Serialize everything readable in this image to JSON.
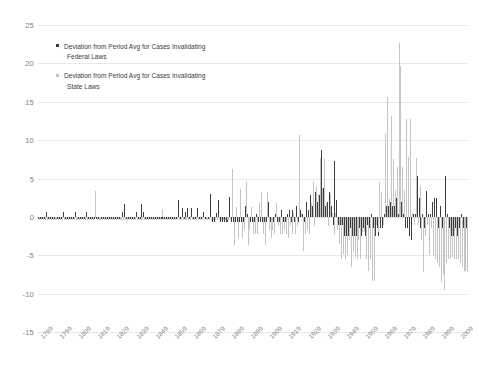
{
  "chart_data": {
    "type": "bar",
    "title": "",
    "subtitle": "",
    "xlabel": "",
    "ylabel": "",
    "ylim": [
      -15,
      25
    ],
    "yticks": [
      25,
      20,
      15,
      10,
      5,
      0,
      -5,
      -10,
      -15
    ],
    "grid": true,
    "legend_position": "inside-top-left",
    "xlim": [
      1789,
      2013
    ],
    "xtick_labels": [
      "1789",
      "1799",
      "1809",
      "1819",
      "1829",
      "1839",
      "1849",
      "1859",
      "1869",
      "1879",
      "1889",
      "1899",
      "1909",
      "1919",
      "1929",
      "1939",
      "1949",
      "1959",
      "1969",
      "1979",
      "1989",
      "1999",
      "2009"
    ],
    "colors": {
      "federal": "#3d3d3d",
      "state": "#c4c4c4",
      "gridline": "#e8e8e8",
      "tick_text": "#8a8a8a",
      "background": "#ffffff"
    },
    "series": [
      {
        "name": "Deviation from Period Avg for Cases Invalidating Federal Laws",
        "short_name": "federal",
        "color": "#3d3d3d",
        "x_start": 1789,
        "values": [
          -0.3,
          -0.3,
          -0.3,
          -0.3,
          0.7,
          -0.3,
          -0.3,
          -0.3,
          -0.3,
          -0.3,
          -0.3,
          -0.3,
          -0.3,
          0.7,
          -0.3,
          -0.3,
          -0.3,
          -0.3,
          -0.3,
          0.7,
          -0.3,
          -0.3,
          -0.3,
          -0.3,
          -0.3,
          0.7,
          -0.3,
          -0.3,
          -0.3,
          -0.3,
          -0.3,
          -0.3,
          -0.3,
          -0.3,
          -0.3,
          -0.3,
          -0.3,
          -0.3,
          -0.3,
          -0.3,
          -0.3,
          -0.3,
          -0.3,
          -0.3,
          0.7,
          1.7,
          -0.3,
          -0.3,
          -0.3,
          -0.3,
          -0.3,
          0.7,
          -0.3,
          -0.3,
          1.7,
          0.7,
          -0.3,
          -0.3,
          -0.3,
          -0.3,
          -0.3,
          -0.3,
          -0.3,
          -0.3,
          -0.3,
          -0.3,
          -0.3,
          -0.3,
          -0.3,
          -0.3,
          -0.3,
          -0.3,
          -0.3,
          2.2,
          -0.3,
          1.2,
          -0.3,
          0.7,
          1.2,
          -0.3,
          1.2,
          -0.3,
          -0.3,
          1.2,
          -0.3,
          -0.3,
          0.7,
          -0.3,
          -0.3,
          -0.3,
          3.0,
          -0.7,
          -0.7,
          0.5,
          2.2,
          -0.7,
          -0.7,
          -0.7,
          -0.7,
          -0.7,
          2.6,
          -0.7,
          -0.7,
          -0.7,
          -0.7,
          -0.7,
          -0.7,
          -0.7,
          1.4,
          0.4,
          -0.7,
          -0.7,
          -0.7,
          -0.7,
          0.4,
          -0.7,
          -0.7,
          -0.7,
          -0.7,
          -0.7,
          1.9,
          -0.7,
          -0.7,
          -0.7,
          0.4,
          -0.7,
          -0.7,
          0.9,
          -0.7,
          -0.7,
          0.4,
          0.9,
          -0.7,
          0.9,
          -0.7,
          1.4,
          -0.7,
          0.9,
          0.4,
          -0.7,
          1.9,
          0.9,
          2.9,
          1.4,
          0.4,
          3.3,
          1.9,
          2.9,
          8.7,
          3.8,
          1.4,
          1.9,
          3.3,
          1.4,
          -1.1,
          7.3,
          2.2,
          -1.1,
          -1.1,
          -1.1,
          -2.5,
          -2.5,
          -2.5,
          -1.5,
          -2.5,
          -2.5,
          -2.5,
          -2.5,
          -1.5,
          -2.5,
          -1.5,
          -2.5,
          -1.0,
          -1.5,
          0.4,
          -1.5,
          -2.5,
          -1.5,
          -2.5,
          -1.5,
          -1.5,
          0.4,
          1.4,
          1.4,
          1.9,
          1.4,
          1.4,
          2.4,
          0.4,
          2.4,
          1.9,
          0.4,
          -1.5,
          -1.5,
          -2.5,
          -3.0,
          0.4,
          0.4,
          5.3,
          2.4,
          -1.5,
          0.4,
          -1.5,
          3.4,
          0.4,
          0.4,
          1.9,
          2.4,
          2.4,
          -1.5,
          1.4,
          -1.5,
          -1.5,
          5.3,
          0.4,
          -1.5,
          -2.5,
          -2.5,
          -1.5,
          -2.5,
          -1.5,
          0.4,
          -1.5,
          -2.5,
          -1.5
        ]
      },
      {
        "name": "Deviation from Period Avg for Cases Invalidating State Laws",
        "short_name": "state",
        "color": "#c4c4c4",
        "x_start": 1789,
        "values": [
          -0.4,
          -0.4,
          -0.4,
          -0.4,
          -0.4,
          -0.4,
          -0.4,
          -0.4,
          -0.4,
          -0.4,
          -0.4,
          -0.4,
          -0.4,
          -0.4,
          -0.4,
          -0.4,
          -0.4,
          -0.4,
          -0.4,
          -0.4,
          -0.4,
          -0.4,
          -0.4,
          -0.4,
          -0.4,
          -0.4,
          -0.4,
          -0.4,
          -0.4,
          3.4,
          -0.4,
          -0.4,
          -0.4,
          -0.4,
          -0.4,
          -0.4,
          -0.4,
          -0.4,
          -0.4,
          -0.4,
          -0.4,
          -0.4,
          -0.4,
          -0.4,
          -0.4,
          -0.4,
          -0.4,
          -0.4,
          -0.4,
          -0.4,
          -0.4,
          -0.4,
          -0.4,
          -0.4,
          -0.4,
          -0.4,
          -0.4,
          -0.4,
          -0.4,
          -0.4,
          -0.4,
          -0.4,
          -0.4,
          -0.4,
          1.0,
          -0.4,
          -0.4,
          -0.4,
          -0.4,
          -0.4,
          -0.4,
          -0.4,
          -0.4,
          -0.4,
          -0.4,
          -0.4,
          -0.4,
          -0.4,
          -0.4,
          -0.4,
          -0.4,
          -0.4,
          -0.4,
          -0.4,
          -0.4,
          -0.4,
          -0.4,
          -0.4,
          -0.4,
          -0.4,
          -0.4,
          -0.4,
          -0.4,
          -0.4,
          -0.4,
          -0.4,
          -0.4,
          -0.4,
          -0.4,
          -0.4,
          -0.4,
          6.3,
          -3.7,
          1.3,
          -2.7,
          3.6,
          -2.7,
          -1.7,
          4.5,
          -3.6,
          -1.7,
          1.3,
          -2.2,
          -2.2,
          -2.2,
          1.8,
          3.3,
          -2.2,
          -3.7,
          3.3,
          -1.7,
          -2.7,
          -1.7,
          -2.2,
          1.8,
          -1.2,
          -2.2,
          -2.2,
          -1.7,
          -2.2,
          -2.7,
          -1.2,
          -2.2,
          0.5,
          -2.2,
          -1.2,
          10.7,
          0.5,
          -4.5,
          -2.2,
          -1.7,
          -2.2,
          1.8,
          4.5,
          -1.2,
          4.0,
          3.0,
          7.7,
          3.8,
          7.5,
          1.8,
          -1.2,
          3.0,
          0.5,
          -2.2,
          0.5,
          -1.7,
          -3.5,
          -5.5,
          -4.9,
          -5.5,
          -5.0,
          -3.0,
          -6.5,
          -4.5,
          -5.2,
          -5.5,
          -3.0,
          -5.5,
          -2.0,
          -2.0,
          -5.5,
          -7.0,
          -5.5,
          -8.3,
          -8.3,
          -1.0,
          -2.0,
          4.5,
          3.2,
          -1.0,
          10.8,
          15.6,
          2.3,
          13.2,
          7.5,
          3.5,
          6.5,
          22.6,
          19.7,
          6.5,
          3.5,
          12.8,
          7.8,
          12.8,
          0.5,
          -1.0,
          7.7,
          -1.0,
          4.0,
          -3.0,
          -7.2,
          -2.5,
          -1.0,
          -5.0,
          -1.5,
          -5.0,
          -5.5,
          -6.0,
          -6.5,
          -8.5,
          -7.5,
          -9.5,
          -6.0,
          -5.5,
          -5.5,
          -5.2,
          -5.5,
          -5.5,
          -5.5,
          -6.0,
          -6.5,
          -7.0,
          -7.0,
          -7.2
        ]
      }
    ]
  },
  "legend": {
    "items": [
      {
        "marker": "federal",
        "line1": "Deviation from Period Avg for Cases Invalidating",
        "line2": "Federal Laws"
      },
      {
        "marker": "state",
        "line1": "Deviation from Period Avg for Cases Invalidating",
        "line2": "State Laws"
      }
    ]
  }
}
